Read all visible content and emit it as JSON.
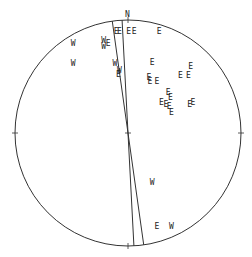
{
  "diagram": {
    "type": "stereonet",
    "north_label": "N",
    "colors": {
      "stroke": "#333333",
      "text": "#222222",
      "background": "#ffffff"
    },
    "great_circles": [
      {
        "name": "plane-1",
        "azimuth_top_deg": -8,
        "azimuth_bottom_deg": 172
      },
      {
        "name": "plane-2",
        "azimuth_top_deg": -3,
        "azimuth_bottom_deg": 177
      }
    ],
    "markers": [
      {
        "label": "W",
        "x": -0.48,
        "y": 0.8
      },
      {
        "label": "W",
        "x": -0.48,
        "y": 0.62
      },
      {
        "label": "W",
        "x": -0.21,
        "y": 0.82
      },
      {
        "label": "E",
        "x": -0.17,
        "y": 0.8
      },
      {
        "label": "W",
        "x": -0.21,
        "y": 0.77
      },
      {
        "label": "E",
        "x": -0.1,
        "y": 0.9
      },
      {
        "label": "E",
        "x": -0.07,
        "y": 0.9
      },
      {
        "label": "E",
        "x": 0.01,
        "y": 0.9
      },
      {
        "label": "E",
        "x": 0.06,
        "y": 0.9
      },
      {
        "label": "E",
        "x": 0.28,
        "y": 0.9
      },
      {
        "label": "W",
        "x": -0.11,
        "y": 0.62
      },
      {
        "label": "W",
        "x": -0.07,
        "y": 0.56
      },
      {
        "label": "E",
        "x": -0.08,
        "y": 0.52
      },
      {
        "label": "E",
        "x": 0.22,
        "y": 0.63
      },
      {
        "label": "E",
        "x": 0.56,
        "y": 0.59
      },
      {
        "label": "E",
        "x": 0.19,
        "y": 0.5
      },
      {
        "label": "E",
        "x": 0.2,
        "y": 0.46
      },
      {
        "label": "E",
        "x": 0.26,
        "y": 0.46
      },
      {
        "label": "E",
        "x": 0.47,
        "y": 0.51
      },
      {
        "label": "E",
        "x": 0.54,
        "y": 0.51
      },
      {
        "label": "E",
        "x": 0.36,
        "y": 0.36
      },
      {
        "label": "E",
        "x": 0.38,
        "y": 0.32
      },
      {
        "label": "E",
        "x": 0.3,
        "y": 0.27
      },
      {
        "label": "E",
        "x": 0.34,
        "y": 0.26
      },
      {
        "label": "E",
        "x": 0.37,
        "y": 0.24
      },
      {
        "label": "E",
        "x": 0.39,
        "y": 0.19
      },
      {
        "label": "E",
        "x": 0.58,
        "y": 0.27
      },
      {
        "label": "E",
        "x": 0.55,
        "y": 0.26
      },
      {
        "label": "W",
        "x": 0.22,
        "y": -0.43
      },
      {
        "label": "E",
        "x": 0.26,
        "y": -0.82
      },
      {
        "label": "W",
        "x": 0.39,
        "y": -0.82
      }
    ]
  }
}
